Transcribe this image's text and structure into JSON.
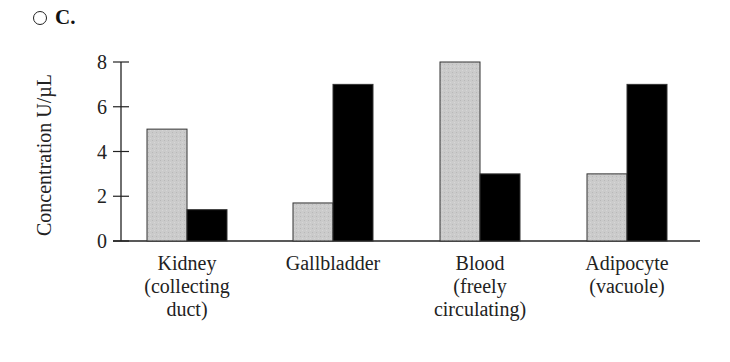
{
  "option": {
    "letter": "C.",
    "selected": false
  },
  "chart_data": {
    "type": "bar",
    "title": "",
    "xlabel": "",
    "ylabel": "Concentration U/µL",
    "ylim": [
      0,
      8
    ],
    "yticks": [
      0,
      2,
      4,
      6,
      8
    ],
    "grid": false,
    "legend": null,
    "categories": [
      "Kidney (collecting duct)",
      "Gallbladder",
      "Blood (freely circulating)",
      "Adipocyte (vacuole)"
    ],
    "category_lines": [
      [
        "Kidney",
        "(collecting",
        "duct)"
      ],
      [
        "Gallbladder"
      ],
      [
        "Blood",
        "(freely",
        "circulating)"
      ],
      [
        "Adipocyte",
        "(vacuole)"
      ]
    ],
    "series": [
      {
        "name": "Series 1 (light gray)",
        "color": "#c8c8c8",
        "values": [
          5,
          1.7,
          8,
          3
        ]
      },
      {
        "name": "Series 2 (black)",
        "color": "#000000",
        "values": [
          1.4,
          7,
          3,
          7
        ]
      }
    ]
  }
}
